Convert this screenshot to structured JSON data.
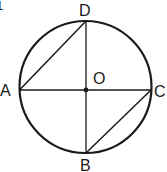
{
  "figure": {
    "number_label": "1",
    "points": {
      "A": {
        "label": "A",
        "x": 18,
        "y": 90
      },
      "B": {
        "label": "B",
        "x": 86,
        "y": 153
      },
      "C": {
        "label": "C",
        "x": 150,
        "y": 90
      },
      "D": {
        "label": "D",
        "x": 86,
        "y": 21
      },
      "O": {
        "label": "O",
        "x": 85,
        "y": 90
      }
    },
    "circle": {
      "cx": 85,
      "cy": 87,
      "r": 66
    },
    "segments": [
      "AC",
      "DB",
      "AD",
      "CB"
    ],
    "stroke_color": "#1a1a1a"
  }
}
